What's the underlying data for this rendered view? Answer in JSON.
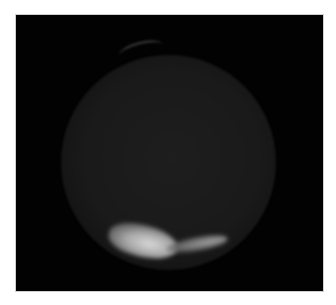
{
  "image": {
    "subject": "planet-disk-with-polar-cap",
    "description": "Dark, grainy planetary disk on black background with a bright polar cap feature at the bottom and a faint limb arc near the top",
    "colors": {
      "border": "#ffffff",
      "background": "#020202",
      "disk": "#1a1a1a",
      "cap": "#c8c8c8"
    }
  }
}
